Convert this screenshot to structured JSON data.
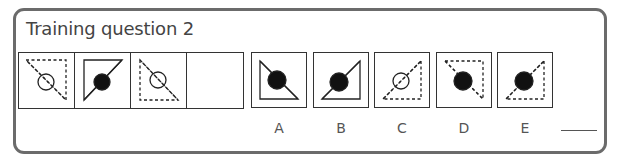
{
  "title": "Training question 2",
  "colors": {
    "frame": "#6b6b6b",
    "stroke": "#222222",
    "fill_dark": "#111111",
    "label": "#555555"
  },
  "question": {
    "cells": [
      {
        "id": "q1",
        "triangle": "M6,6 L46,6 L46,46 Z",
        "dashed": true,
        "line": "M8,8 L46,46",
        "circle": {
          "cx": 26,
          "cy": 28,
          "r": 8,
          "filled": false
        }
      },
      {
        "id": "q2",
        "triangle": "M8,6 L46,6 L8,46 Z",
        "dashed": false,
        "line": "M8,46 L46,6",
        "circle": {
          "cx": 26,
          "cy": 28,
          "r": 8,
          "filled": true
        }
      },
      {
        "id": "q3",
        "triangle": "M8,6 L8,46 L46,46 Z",
        "dashed": true,
        "line": "M8,6 L46,46",
        "circle": {
          "cx": 26,
          "cy": 26,
          "r": 8,
          "filled": false
        }
      },
      {
        "id": "q4",
        "empty": true
      }
    ]
  },
  "options": [
    {
      "label": "A",
      "left": 251,
      "triangle": "M8,8 L8,46 L46,46 Z",
      "dashed": false,
      "line": "M8,8 L46,46",
      "circle": {
        "cx": 25,
        "cy": 27,
        "r": 9,
        "filled": true
      }
    },
    {
      "label": "B",
      "left": 313,
      "triangle": "M46,8 L46,46 L8,46 Z",
      "dashed": false,
      "line": "M8,46 L46,8",
      "circle": {
        "cx": 25,
        "cy": 29,
        "r": 9,
        "filled": true
      }
    },
    {
      "label": "C",
      "left": 374,
      "triangle": "M46,8 L46,46 L8,46 Z",
      "dashed": true,
      "line": "M8,46 L46,8",
      "circle": {
        "cx": 26,
        "cy": 28,
        "r": 8,
        "filled": false
      }
    },
    {
      "label": "D",
      "left": 436,
      "triangle": "M8,8 L46,8 L46,46 Z",
      "dashed": true,
      "line": "M8,8 L46,46",
      "circle": {
        "cx": 26,
        "cy": 28,
        "r": 9,
        "filled": true
      }
    },
    {
      "label": "E",
      "left": 497,
      "triangle": "M46,8 L46,46 L8,46 Z",
      "dashed": true,
      "line": "M8,46 L46,8",
      "circle": {
        "cx": 26,
        "cy": 28,
        "r": 9,
        "filled": true
      }
    }
  ],
  "answer": {
    "value": ""
  }
}
